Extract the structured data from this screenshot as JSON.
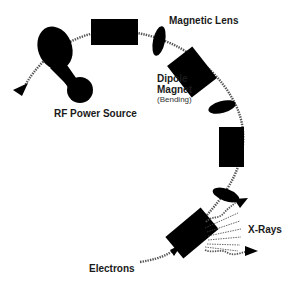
{
  "diagram": {
    "labels": {
      "magnetic_lens": "Magnetic Lens",
      "dipole_magnet_line1": "Dipole",
      "dipole_magnet_line2": "Magnet",
      "dipole_magnet_note": "(Bending)",
      "rf_power_source": "RF Power Source",
      "x_rays": "X-Rays",
      "electrons": "Electrons"
    },
    "colors": {
      "component": "#000000",
      "beam": "#555555",
      "text": "#1a1a1a",
      "background": "#ffffff"
    }
  }
}
